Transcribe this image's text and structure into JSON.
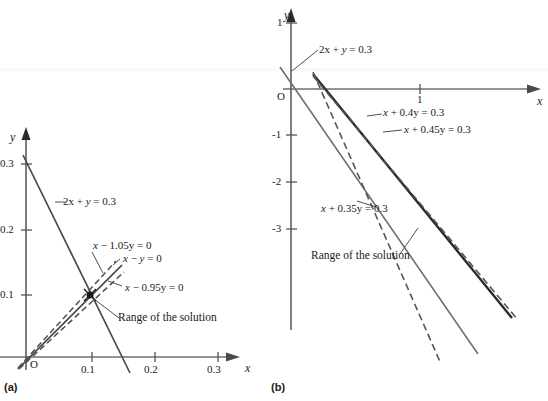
{
  "figure": {
    "panels": [
      {
        "id": "a",
        "caption": "(a)",
        "axes": {
          "x_label": "x",
          "y_label": "y",
          "x_ticks": [
            "0.1",
            "0.2",
            "0.3"
          ],
          "y_ticks": [
            "0.3",
            "0.2",
            "0.1"
          ],
          "origin_label": "O"
        },
        "annotations": [
          "2x + y = 0.3",
          "x − 1.05y = 0",
          "x − y = 0",
          "x − 0.95y = 0",
          "Range of the solution"
        ]
      },
      {
        "id": "b",
        "caption": "(b)",
        "axes": {
          "x_label": "x",
          "y_label": "y",
          "x_ticks": [
            "1"
          ],
          "y_ticks": [
            "1",
            "-1",
            "-2",
            "-3"
          ],
          "origin_label": "O"
        },
        "annotations": [
          "2x + y = 0.3",
          "x + 0.4y = 0.3",
          "x + 0.45y = 0.3",
          "x + 0.35y = 0.3",
          "Range of the solution"
        ]
      }
    ]
  },
  "labels": {
    "a_eq_2xy": "2x + y = 0.3",
    "a_eq_105": "x − 1.05y = 0",
    "a_eq_xy": "x − y = 0",
    "a_eq_095": "x − 0.95y = 0",
    "a_range": "Range of the solution",
    "a_y": "y",
    "a_x": "x",
    "a_O": "O",
    "a_t03": "0.3",
    "a_t02": "0.2",
    "a_t01": "0.1",
    "a_tx01": "0.1",
    "a_tx02": "0.2",
    "a_tx03": "0.3",
    "a_caption": "(a)",
    "b_eq_2xy": "2x + y = 0.3",
    "b_eq_04": "x + 0.4y = 0.3",
    "b_eq_045": "x + 0.45y = 0.3",
    "b_eq_035": "x + 0.35y = 0.3",
    "b_range": "Range of the solution",
    "b_y": "y",
    "b_x": "x",
    "b_O": "O",
    "b_t1": "1",
    "b_tm1": "-1",
    "b_tm2": "-2",
    "b_tm3": "-3",
    "b_tx1": "1",
    "b_caption": "(b)"
  },
  "chart_data": {
    "type": "line",
    "title": "",
    "panels": [
      {
        "id": "a",
        "xlim": [
          -0.01,
          0.34
        ],
        "ylim": [
          -0.012,
          0.345
        ],
        "xlabel": "x",
        "ylabel": "y",
        "xticks": [
          0.1,
          0.2,
          0.3
        ],
        "yticks": [
          0.1,
          0.2,
          0.3
        ],
        "grid": false,
        "solution_point": [
          0.1,
          0.1
        ],
        "series": [
          {
            "name": "2x + y = 0.3",
            "style": "solid",
            "color": "#4a4a4a",
            "points": [
              [
                -0.005,
                0.31
              ],
              [
                0.17,
                -0.04
              ]
            ]
          },
          {
            "name": "x - y = 0",
            "style": "solid",
            "color": "#4a4a4a",
            "points": [
              [
                -0.012,
                -0.012
              ],
              [
                0.145,
                0.145
              ]
            ]
          },
          {
            "name": "x - 1.05y = 0",
            "style": "dashed",
            "color": "#555555",
            "points": [
              [
                -0.012,
                -0.0114
              ],
              [
                0.135,
                0.1286
              ]
            ]
          },
          {
            "name": "x - 0.95y = 0",
            "style": "dashed",
            "color": "#555555",
            "points": [
              [
                -0.012,
                -0.0126
              ],
              [
                0.135,
                0.1421
              ]
            ]
          }
        ]
      },
      {
        "id": "b",
        "xlim": [
          -0.05,
          2.0
        ],
        "ylim": [
          -4.2,
          1.35
        ],
        "xlabel": "x",
        "ylabel": "y",
        "xticks": [
          1
        ],
        "yticks": [
          1,
          -1,
          -2,
          -3
        ],
        "grid": false,
        "series": [
          {
            "name": "2x + y = 0.3",
            "style": "solid",
            "color": "#6a6a6a",
            "points": [
              [
                -0.09,
                0.48
              ],
              [
                1.45,
                -2.6
              ]
            ]
          },
          {
            "name": "x + 0.4y = 0.3",
            "style": "solid",
            "color": "#3a3a3a",
            "points": [
              [
                0.17,
                0.33
              ],
              [
                1.62,
                -3.3
              ]
            ]
          },
          {
            "name": "x + 0.45y = 0.3",
            "style": "dashed",
            "color": "#555555",
            "points": [
              [
                0.17,
                0.29
              ],
              [
                1.5,
                -2.67
              ]
            ]
          },
          {
            "name": "x + 0.35y = 0.3",
            "style": "dashed",
            "color": "#555555",
            "points": [
              [
                0.17,
                0.37
              ],
              [
                1.3,
                -2.86
              ]
            ]
          }
        ]
      }
    ]
  }
}
